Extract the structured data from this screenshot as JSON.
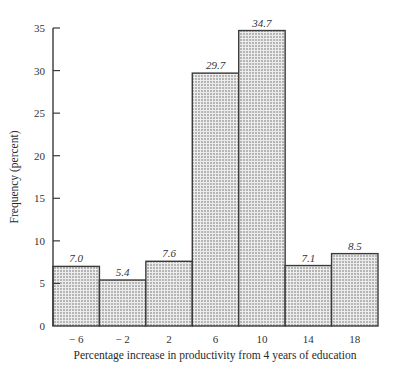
{
  "chart_data": {
    "type": "bar",
    "title": "",
    "xlabel": "Percentage increase in productivity from 4 years of education",
    "ylabel": "Frequency (percent)",
    "categories": [
      "− 6",
      "− 2",
      "2",
      "6",
      "10",
      "14",
      "18"
    ],
    "values": [
      7.0,
      5.4,
      7.6,
      29.7,
      34.7,
      7.1,
      8.5
    ],
    "value_labels": [
      "7.0",
      "5.4",
      "7.6",
      "29.7",
      "34.7",
      "7.1",
      "8.5"
    ],
    "ylim": [
      0,
      35
    ],
    "yticks": [
      0,
      5,
      10,
      15,
      20,
      25,
      30,
      35
    ],
    "grid": false,
    "legend": null,
    "bar_style": "stippled (dotted fill) with dark outline, adjacent bars (histogram)"
  },
  "colors": {
    "outline": "#3a3a3a",
    "fill_base": "#e8e8e8",
    "dot": "#555555",
    "text": "#2a2a2a"
  }
}
